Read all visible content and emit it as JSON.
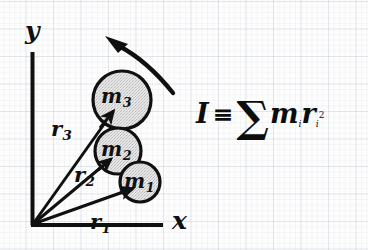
{
  "figure": {
    "background_color": "#fdfdfd",
    "ink_color": "#101010",
    "grid_color": "#96a0af",
    "circle_fill": "#e2e2e2",
    "axes": {
      "x_label": "x",
      "y_label": "y",
      "origin": [
        32,
        225
      ],
      "x_end": [
        163,
        225
      ],
      "y_end": [
        32,
        52
      ]
    },
    "masses": [
      {
        "label": "m",
        "index": "1",
        "name": "mass-1",
        "cx": 140,
        "cy": 182,
        "r": 20
      },
      {
        "label": "m",
        "index": "2",
        "name": "mass-2",
        "cx": 118,
        "cy": 151,
        "r": 23
      },
      {
        "label": "m",
        "index": "3",
        "name": "mass-3",
        "cx": 122,
        "cy": 100,
        "r": 29
      }
    ],
    "radius_vectors": [
      {
        "label": "r",
        "index": "1",
        "name": "radius-vector-1",
        "from": [
          32,
          225
        ],
        "to": [
          134,
          188
        ]
      },
      {
        "label": "r",
        "index": "2",
        "name": "radius-vector-2",
        "from": [
          32,
          225
        ],
        "to": [
          112,
          158
        ]
      },
      {
        "label": "r",
        "index": "3",
        "name": "radius-vector-3",
        "from": [
          32,
          225
        ],
        "to": [
          114,
          110
        ]
      }
    ],
    "rotation_arrow": {
      "name": "rotation-direction-arrow",
      "description": "curved arrow indicating direction of rotation, pointing up-left"
    },
    "formula": {
      "lhs": "I",
      "relation": "≡",
      "operator": "∑",
      "term_mass": "m",
      "term_radius": "r",
      "subscript": "i",
      "exponent": "2",
      "plain": "I ≡ ∑ mᵢrᵢ²"
    }
  }
}
